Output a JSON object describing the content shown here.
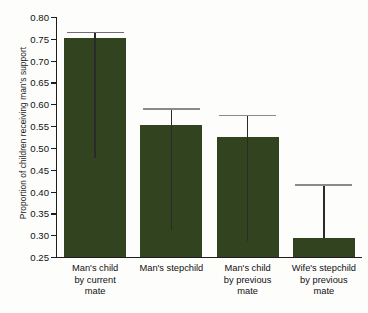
{
  "chart_data": {
    "type": "bar",
    "title": "",
    "xlabel": "",
    "ylabel": "Proportion of children receiving man's support",
    "ylim": [
      0.25,
      0.8
    ],
    "grid": false,
    "legend": false,
    "categories": [
      "Man's child by current mate",
      "Man's stepchild",
      "Man's child by previous mate",
      "Wife's stepchild by previous mate"
    ],
    "category_lines": [
      [
        "Man's child",
        "by current",
        "mate"
      ],
      [
        "Man's stepchild"
      ],
      [
        "Man's child",
        "by previous",
        "mate"
      ],
      [
        "Wife's stepchild",
        "by previous",
        "mate"
      ]
    ],
    "values": [
      0.752,
      0.553,
      0.524,
      0.294
    ],
    "error_upper": [
      0.766,
      0.591,
      0.576,
      0.417
    ],
    "error_lower": [
      0.476,
      0.312,
      0.286,
      0.294
    ],
    "yticks": [
      0.8,
      0.75,
      0.7,
      0.65,
      0.6,
      0.55,
      0.5,
      0.45,
      0.4,
      0.35,
      0.3,
      0.25
    ],
    "ytick_labels": [
      "0.80",
      "0.75",
      "0.70",
      "0.65",
      "0.60",
      "0.55",
      "0.50",
      "0.45",
      "0.40",
      "0.35",
      "0.30",
      "0.25"
    ],
    "bar_color": "#31441f",
    "axis_color": "#1d1d1d",
    "error_bar_color": "#6f6f6f"
  },
  "caption": {
    "text": ""
  }
}
